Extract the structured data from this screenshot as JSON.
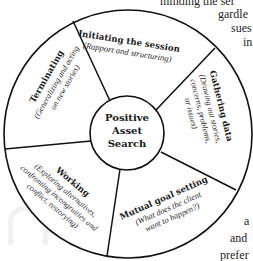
{
  "diagram": {
    "center": {
      "lines": [
        "Positive",
        "Asset",
        "Search"
      ]
    },
    "segments": [
      {
        "id": "initiating",
        "title": "Initiating the session",
        "subtitle_lines": [
          "(Rapport and structuring)"
        ]
      },
      {
        "id": "gathering",
        "title": "Gathering data",
        "subtitle_lines": [
          "(Drawing out stories,",
          "concerns, problems,",
          "or issues)"
        ]
      },
      {
        "id": "mutual",
        "title": "Mutual goal setting",
        "subtitle_lines": [
          "(What does the client",
          "want to happen?)"
        ]
      },
      {
        "id": "working",
        "title": "Working",
        "subtitle_lines": [
          "(Exploring alternatives,",
          "confronting incongruities and",
          "conflict, restorying)"
        ]
      },
      {
        "id": "terminating",
        "title": "Terminating",
        "subtitle_lines": [
          "(Generalizing and acting",
          "on new stories)"
        ]
      }
    ]
  },
  "background_text": {
    "lines": [
      "minding the ser",
      "gardle",
      "sues",
      "in",
      "a",
      "and",
      "prefer"
    ]
  },
  "colors": {
    "stroke": "#111111",
    "background": "#ffffff",
    "text": "#1a1a1a"
  }
}
